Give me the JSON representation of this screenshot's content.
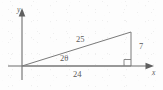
{
  "figure": {
    "type": "geometry-diagram",
    "background_color": "#fdfdfd",
    "stroke_color": "#7a7a7a",
    "text_color": "#5a5a5a",
    "axes": {
      "x_label": "x",
      "y_label": "y",
      "origin": {
        "x": 22,
        "y": 66
      }
    },
    "triangle": {
      "vertices": {
        "origin": {
          "x": 22,
          "y": 66
        },
        "base_end": {
          "x": 131,
          "y": 66
        },
        "apex": {
          "x": 131,
          "y": 32
        }
      },
      "right_angle_vertex": "base_end"
    },
    "labels": {
      "hypotenuse": "25",
      "opposite": "7",
      "adjacent": "24",
      "angle": "2θ"
    }
  }
}
